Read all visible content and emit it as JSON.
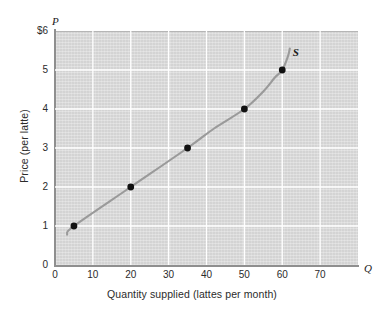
{
  "chart_data": {
    "type": "line",
    "title": "",
    "xlabel": "Quantity supplied (lattes per month)",
    "ylabel": "Price (per latte)",
    "x_axis_symbol": "Q",
    "y_axis_symbol": "P",
    "series_label": "S",
    "xlim": [
      0,
      80
    ],
    "ylim": [
      0,
      6
    ],
    "xticks": [
      0,
      10,
      20,
      30,
      40,
      50,
      60,
      70
    ],
    "xtick_labels": [
      "0",
      "10",
      "20",
      "30",
      "40",
      "50",
      "60",
      "70"
    ],
    "yticks": [
      0,
      1,
      2,
      3,
      4,
      5,
      6
    ],
    "ytick_labels": [
      "0",
      "1",
      "2",
      "3",
      "4",
      "5",
      "$6"
    ],
    "grid": true,
    "legend_position": "inline-curve-label",
    "points": [
      {
        "x": 5,
        "y": 1
      },
      {
        "x": 20,
        "y": 2
      },
      {
        "x": 35,
        "y": 3
      },
      {
        "x": 50,
        "y": 4
      },
      {
        "x": 60,
        "y": 5
      }
    ],
    "curve_path": [
      {
        "x": 3.2,
        "y": 0.78
      },
      {
        "x": 5,
        "y": 1
      },
      {
        "x": 20,
        "y": 2
      },
      {
        "x": 35,
        "y": 3
      },
      {
        "x": 42,
        "y": 3.5
      },
      {
        "x": 50,
        "y": 4
      },
      {
        "x": 55,
        "y": 4.45
      },
      {
        "x": 58,
        "y": 4.8
      },
      {
        "x": 60,
        "y": 5
      },
      {
        "x": 61.5,
        "y": 5.35
      },
      {
        "x": 62,
        "y": 5.55
      }
    ],
    "colors": {
      "plot_background": "#d9d9d9",
      "gridline": "#ffffff",
      "curve": "#9a9a9a",
      "point": "#111111",
      "axis": "#8f8f8f",
      "text": "#2b2b2b"
    }
  }
}
